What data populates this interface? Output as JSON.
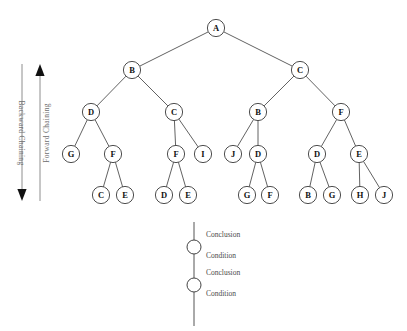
{
  "figure": {
    "background_color": "#ffffff",
    "node_stroke_color": "#3a3a3a",
    "edge_stroke_color": "#3a3a3a",
    "axis_color": "#8e8e8e",
    "axis_text_color": "#6d6d6d",
    "legend_text_color": "#4a4a4a"
  },
  "tree": {
    "node_radius": 8.6,
    "nodes": [
      {
        "id": "n0",
        "label": "A",
        "x": 216,
        "y": 28
      },
      {
        "id": "n1",
        "label": "B",
        "x": 132,
        "y": 70
      },
      {
        "id": "n2",
        "label": "C",
        "x": 300,
        "y": 70
      },
      {
        "id": "n3",
        "label": "D",
        "x": 91,
        "y": 112
      },
      {
        "id": "n4",
        "label": "C",
        "x": 174,
        "y": 112
      },
      {
        "id": "n5",
        "label": "B",
        "x": 258,
        "y": 112
      },
      {
        "id": "n6",
        "label": "F",
        "x": 341,
        "y": 112
      },
      {
        "id": "n7",
        "label": "G",
        "x": 71,
        "y": 154
      },
      {
        "id": "n8",
        "label": "F",
        "x": 113,
        "y": 154
      },
      {
        "id": "n9",
        "label": "F",
        "x": 176,
        "y": 154
      },
      {
        "id": "n10",
        "label": "I",
        "x": 203,
        "y": 154
      },
      {
        "id": "n11",
        "label": "J",
        "x": 233,
        "y": 154
      },
      {
        "id": "n12",
        "label": "D",
        "x": 258,
        "y": 154
      },
      {
        "id": "n13",
        "label": "D",
        "x": 317,
        "y": 154
      },
      {
        "id": "n14",
        "label": "E",
        "x": 359,
        "y": 154
      },
      {
        "id": "n15",
        "label": "C",
        "x": 101,
        "y": 195
      },
      {
        "id": "n16",
        "label": "E",
        "x": 125,
        "y": 195
      },
      {
        "id": "n17",
        "label": "D",
        "x": 164,
        "y": 195
      },
      {
        "id": "n18",
        "label": "E",
        "x": 188,
        "y": 195
      },
      {
        "id": "n19",
        "label": "G",
        "x": 247,
        "y": 195
      },
      {
        "id": "n20",
        "label": "F",
        "x": 270,
        "y": 195
      },
      {
        "id": "n21",
        "label": "B",
        "x": 308,
        "y": 195
      },
      {
        "id": "n22",
        "label": "G",
        "x": 332,
        "y": 195
      },
      {
        "id": "n23",
        "label": "H",
        "x": 360,
        "y": 195
      },
      {
        "id": "n24",
        "label": "J",
        "x": 384,
        "y": 195
      }
    ],
    "edges": [
      [
        "n0",
        "n1"
      ],
      [
        "n0",
        "n2"
      ],
      [
        "n1",
        "n3"
      ],
      [
        "n1",
        "n4"
      ],
      [
        "n2",
        "n5"
      ],
      [
        "n2",
        "n6"
      ],
      [
        "n3",
        "n7"
      ],
      [
        "n3",
        "n8"
      ],
      [
        "n4",
        "n9"
      ],
      [
        "n4",
        "n10"
      ],
      [
        "n5",
        "n11"
      ],
      [
        "n5",
        "n12"
      ],
      [
        "n6",
        "n13"
      ],
      [
        "n6",
        "n14"
      ],
      [
        "n8",
        "n15"
      ],
      [
        "n8",
        "n16"
      ],
      [
        "n9",
        "n17"
      ],
      [
        "n9",
        "n18"
      ],
      [
        "n12",
        "n19"
      ],
      [
        "n12",
        "n20"
      ],
      [
        "n13",
        "n21"
      ],
      [
        "n13",
        "n22"
      ],
      [
        "n14",
        "n23"
      ],
      [
        "n14",
        "n24"
      ]
    ]
  },
  "axes": {
    "backward": {
      "label": "Backward Chaining",
      "direction": "down",
      "x": 22,
      "y_top": 64,
      "y_bottom": 201,
      "label_x": 19,
      "label_y": 133
    },
    "forward": {
      "label": "Forward Chaining",
      "direction": "up",
      "x": 40,
      "y_top": 64,
      "y_bottom": 201,
      "label_x": 49,
      "label_y": 133
    }
  },
  "legend": {
    "line_x": 194,
    "line_top": 222,
    "line_bottom": 326,
    "circle_radius": 7,
    "text_x": 206,
    "nodes": [
      {
        "cy": 247
      },
      {
        "cy": 285
      }
    ],
    "labels": [
      {
        "text": "Conclusion",
        "x": 206,
        "y": 237
      },
      {
        "text": "Condition",
        "x": 206,
        "y": 258
      },
      {
        "text": "Conclusion",
        "x": 206,
        "y": 275
      },
      {
        "text": "Condition",
        "x": 206,
        "y": 296
      }
    ]
  }
}
